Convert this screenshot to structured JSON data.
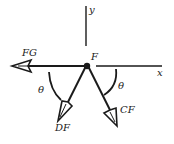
{
  "diagram": {
    "type": "free-body-diagram",
    "node": {
      "label": "F"
    },
    "axes": {
      "x_label": "x",
      "y_label": "y"
    },
    "forces": [
      {
        "name": "FG",
        "label": "FG",
        "direction": "left (negative x)"
      },
      {
        "name": "DF",
        "label": "DF",
        "direction": "down-left, angle θ from negative x-axis"
      },
      {
        "name": "CF",
        "label": "CF",
        "direction": "down-right, angle θ from positive x-axis"
      }
    ],
    "angles": [
      {
        "label": "θ",
        "between": "FG line and DF"
      },
      {
        "label": "θ",
        "between": "x-axis and CF"
      }
    ],
    "colors": {
      "ink": "#1a1a1a",
      "background": "#ffffff"
    }
  }
}
